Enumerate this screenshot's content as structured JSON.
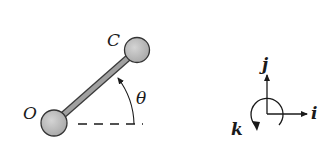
{
  "diagram": {
    "colors": {
      "background": "#ffffff",
      "ink": "#1a1a1a",
      "rod_fill": "#9a9a9a",
      "sphere_fill": "#bdbdbd"
    },
    "rod": {
      "end_labels": {
        "origin": "O",
        "tip": "C"
      },
      "angle_label": "θ",
      "reference_line": "horizontal dashed line from O"
    },
    "axes": {
      "x_label": "i",
      "y_label": "j",
      "z_label": "k",
      "z_rotation_arrow": "counterclockwise curved arrow around origin"
    }
  }
}
